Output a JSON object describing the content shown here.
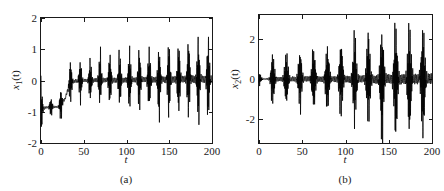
{
  "figure": {
    "background": "#ffffff",
    "trace_color": "#000000",
    "axis_color": "#1a1a1a"
  },
  "chart_data": [
    {
      "type": "line",
      "panel_label": "(a)",
      "title": "",
      "xlabel": "t",
      "ylabel": "x1(t)",
      "ylabel_base": "x",
      "ylabel_sub": "1",
      "ylabel_tail": "(t)",
      "xlim": [
        0,
        200
      ],
      "ylim": [
        -2,
        2
      ],
      "xticks": [
        0,
        50,
        100,
        150,
        200
      ],
      "xticklabels": [
        "0",
        "50",
        "100",
        "150",
        "200"
      ],
      "yticks": [
        -2,
        -1,
        0,
        1,
        2
      ],
      "yticklabels": [
        "-2",
        "-1",
        "0",
        "1",
        "2"
      ],
      "grid": false,
      "legend": null,
      "description": "Chaotic time series x1(t): initial downward transient spike to about -1.6 near t=0, settles onto a plateau near -0.85 until t~28, then grows into intermittent bursting oscillations about zero whose envelope widens from about +/-0.5 to about +1.3 / -1.2 by t=200.",
      "envelope": {
        "t": [
          0,
          5,
          10,
          15,
          20,
          28,
          35,
          45,
          55,
          65,
          80,
          95,
          110,
          125,
          140,
          155,
          170,
          185,
          200
        ],
        "upper": [
          0.0,
          -0.45,
          -0.6,
          -0.25,
          -0.45,
          0.3,
          0.75,
          0.7,
          0.55,
          0.75,
          0.8,
          0.9,
          0.95,
          1.0,
          1.05,
          1.15,
          1.2,
          1.25,
          1.3
        ],
        "lower": [
          -1.65,
          -1.35,
          -1.05,
          -0.95,
          -1.0,
          -0.75,
          -0.45,
          -0.5,
          -0.55,
          -0.7,
          -0.75,
          -0.8,
          -0.85,
          -0.9,
          -1.0,
          -1.05,
          -1.1,
          -1.15,
          -1.2
        ]
      },
      "baseline": {
        "t": [
          0,
          10,
          20,
          28,
          34,
          45,
          200
        ],
        "value": [
          -0.9,
          -0.85,
          -0.85,
          -0.6,
          -0.05,
          0.0,
          0.05
        ]
      },
      "burst_period": 11.5,
      "n_samples": 2000
    },
    {
      "type": "line",
      "panel_label": "(b)",
      "title": "",
      "xlabel": "t",
      "ylabel": "x2(t)",
      "ylabel_base": "x",
      "ylabel_sub": "2",
      "ylabel_tail": "(t)",
      "xlim": [
        0,
        200
      ],
      "ylim": [
        -3.2,
        3.2
      ],
      "xticks": [
        0,
        50,
        100,
        150,
        200
      ],
      "xticklabels": [
        "0",
        "50",
        "100",
        "150",
        "200"
      ],
      "yticks": [
        -2,
        0,
        2
      ],
      "yticklabels": [
        "-2",
        "0",
        "2"
      ],
      "grid": false,
      "legend": null,
      "description": "Chaotic time series x2(t): quiescent near-zero segments interrupted by regularly spaced spiking bursts about zero; burst amplitude grows from roughly +/-1.2 near t=15 to roughly +2.8 / -2.6 by t=200.",
      "envelope": {
        "t": [
          0,
          8,
          16,
          32,
          48,
          64,
          80,
          96,
          112,
          128,
          144,
          160,
          176,
          190,
          200
        ],
        "upper": [
          0.3,
          0.35,
          1.2,
          1.25,
          1.35,
          1.45,
          1.6,
          1.8,
          1.95,
          2.2,
          2.5,
          2.6,
          2.75,
          2.85,
          2.9
        ],
        "lower": [
          -0.3,
          -0.35,
          -1.15,
          -1.2,
          -1.3,
          -1.4,
          -1.5,
          -1.7,
          -1.9,
          -2.1,
          -2.35,
          -2.5,
          -2.6,
          -2.65,
          -2.7
        ]
      },
      "baseline": {
        "t": [
          0,
          200
        ],
        "value": [
          0.0,
          0.0
        ]
      },
      "burst_period": 15.8,
      "n_samples": 2000
    }
  ]
}
